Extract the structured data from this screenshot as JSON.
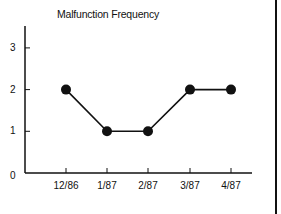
{
  "chart_data": {
    "type": "line",
    "title": "Malfunction Frequency",
    "xlabel": "",
    "ylabel": "",
    "categories": [
      "12/86",
      "1/87",
      "2/87",
      "3/87",
      "4/87"
    ],
    "values": [
      2,
      1,
      1,
      2,
      2
    ],
    "ylim": [
      0,
      3.5
    ],
    "yticks": [
      "0",
      "1",
      "2",
      "3"
    ],
    "grid": false,
    "legend": null,
    "marker": "filled-circle",
    "color": "#111111"
  }
}
